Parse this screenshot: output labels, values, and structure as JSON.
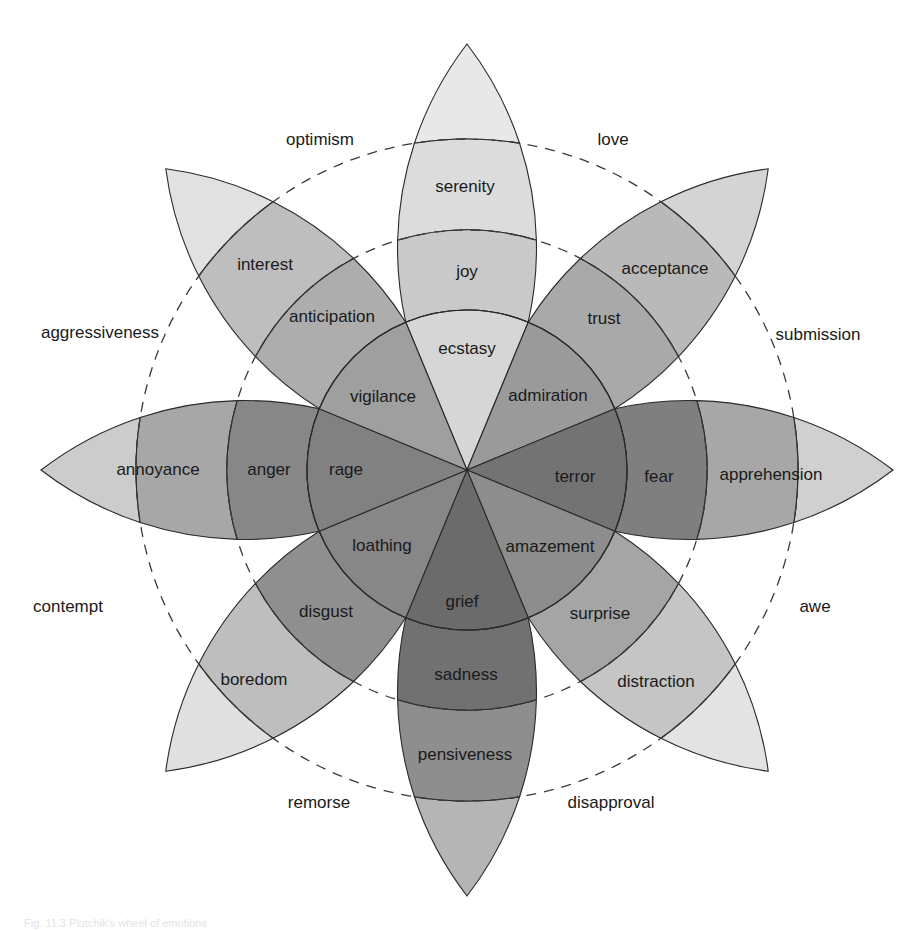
{
  "diagram": {
    "title": "Plutchik's wheel of emotions",
    "petals": [
      {
        "angle_deg": 0,
        "inner": {
          "label": "ecstasy",
          "color": "#d6d6d6"
        },
        "middle": {
          "label": "joy",
          "color": "#c9c9c9"
        },
        "outer": {
          "label": "serenity",
          "color": "#dcdcdc"
        },
        "tip": {
          "color": "#e8e8e8"
        }
      },
      {
        "angle_deg": 45,
        "inner": {
          "label": "admiration",
          "color": "#9a9a9a"
        },
        "middle": {
          "label": "trust",
          "color": "#a9a9a9"
        },
        "outer": {
          "label": "acceptance",
          "color": "#b9b9b9"
        },
        "tip": {
          "color": "#d4d4d4"
        }
      },
      {
        "angle_deg": 90,
        "inner": {
          "label": "terror",
          "color": "#737373"
        },
        "middle": {
          "label": "fear",
          "color": "#7f7f7f"
        },
        "outer": {
          "label": "apprehension",
          "color": "#a7a7a7"
        },
        "tip": {
          "color": "#d0d0d0"
        }
      },
      {
        "angle_deg": 135,
        "inner": {
          "label": "amazement",
          "color": "#8d8d8d"
        },
        "middle": {
          "label": "surprise",
          "color": "#a5a5a5"
        },
        "outer": {
          "label": "distraction",
          "color": "#c5c5c5"
        },
        "tip": {
          "color": "#e3e3e3"
        }
      },
      {
        "angle_deg": 180,
        "inner": {
          "label": "grief",
          "color": "#6b6b6b"
        },
        "middle": {
          "label": "sadness",
          "color": "#717171"
        },
        "outer": {
          "label": "pensiveness",
          "color": "#8e8e8e"
        },
        "tip": {
          "color": "#b5b5b5"
        }
      },
      {
        "angle_deg": 225,
        "inner": {
          "label": "loathing",
          "color": "#878787"
        },
        "middle": {
          "label": "disgust",
          "color": "#8f8f8f"
        },
        "outer": {
          "label": "boredom",
          "color": "#bebebe"
        },
        "tip": {
          "color": "#e0e0e0"
        }
      },
      {
        "angle_deg": 270,
        "inner": {
          "label": "rage",
          "color": "#818181"
        },
        "middle": {
          "label": "anger",
          "color": "#878787"
        },
        "outer": {
          "label": "annoyance",
          "color": "#a7a7a7"
        },
        "tip": {
          "color": "#cccccc"
        }
      },
      {
        "angle_deg": 315,
        "inner": {
          "label": "vigilance",
          "color": "#9f9f9f"
        },
        "middle": {
          "label": "anticipation",
          "color": "#adadad"
        },
        "outer": {
          "label": "interest",
          "color": "#bebebe"
        },
        "tip": {
          "color": "#e1e1e1"
        }
      }
    ],
    "dyads": [
      {
        "label": "love",
        "x": 613,
        "y": 145
      },
      {
        "label": "submission",
        "x": 818,
        "y": 340
      },
      {
        "label": "awe",
        "x": 815,
        "y": 612
      },
      {
        "label": "disapproval",
        "x": 611,
        "y": 808
      },
      {
        "label": "remorse",
        "x": 319,
        "y": 808
      },
      {
        "label": "contempt",
        "x": 68,
        "y": 612
      },
      {
        "label": "aggressiveness",
        "x": 100,
        "y": 338
      },
      {
        "label": "optimism",
        "x": 320,
        "y": 145
      }
    ],
    "label_positions": {
      "ecstasy": [
        467,
        348
      ],
      "joy": [
        467,
        271
      ],
      "serenity": [
        465,
        186
      ],
      "admiration": [
        548,
        395
      ],
      "trust": [
        604,
        318
      ],
      "acceptance": [
        665,
        268
      ],
      "terror": [
        575,
        476
      ],
      "fear": [
        659,
        476
      ],
      "apprehension": [
        771,
        474
      ],
      "amazement": [
        550,
        546
      ],
      "surprise": [
        600,
        613
      ],
      "distraction": [
        656,
        681
      ],
      "grief": [
        462,
        601
      ],
      "sadness": [
        466,
        674
      ],
      "pensiveness": [
        465,
        754
      ],
      "loathing": [
        382,
        545
      ],
      "disgust": [
        326,
        611
      ],
      "boredom": [
        254,
        679
      ],
      "rage": [
        346,
        469
      ],
      "anger": [
        269,
        469
      ],
      "annoyance": [
        158,
        469
      ],
      "vigilance": [
        383,
        396
      ],
      "anticipation": [
        332,
        316
      ],
      "interest": [
        265,
        264
      ]
    },
    "line_color": "#2a2a2a",
    "dash_color": "#3a3a3a"
  },
  "caption": "Fig. 11.3  Plutchik's wheel of emotions"
}
